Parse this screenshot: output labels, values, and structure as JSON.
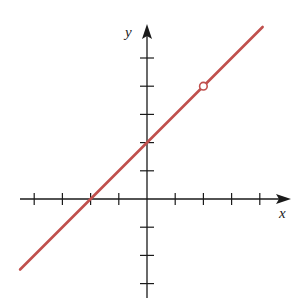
{
  "chart_data": {
    "type": "line",
    "title": "",
    "xlabel": "x",
    "ylabel": "y",
    "xlim": [
      -4,
      5
    ],
    "ylim": [
      -4,
      6
    ],
    "grid": false,
    "x_ticks": [
      -4,
      -3,
      -2,
      -1,
      1,
      2,
      3,
      4
    ],
    "y_ticks": [
      -3,
      -2,
      -1,
      1,
      2,
      3,
      4,
      5
    ],
    "tick_labels_shown": false,
    "series": [
      {
        "name": "y = x + 2",
        "equation": "y = x + 2",
        "slope": 1,
        "intercept": 2,
        "color": "#c0504d",
        "x": [
          -4.5,
          4.1
        ],
        "y": [
          -2.5,
          6.1
        ]
      }
    ],
    "annotations": [
      {
        "type": "open-circle",
        "x": 2,
        "y": 4,
        "color": "#c0504d",
        "note": "hole in graph"
      }
    ]
  },
  "labels": {
    "x_axis": "x",
    "y_axis": "y"
  },
  "colors": {
    "line": "#c0504d",
    "axis": "#1a1a1a",
    "background": "#ffffff"
  },
  "layout": {
    "origin_px": [
      147,
      199
    ],
    "unit_px": 28.2
  }
}
